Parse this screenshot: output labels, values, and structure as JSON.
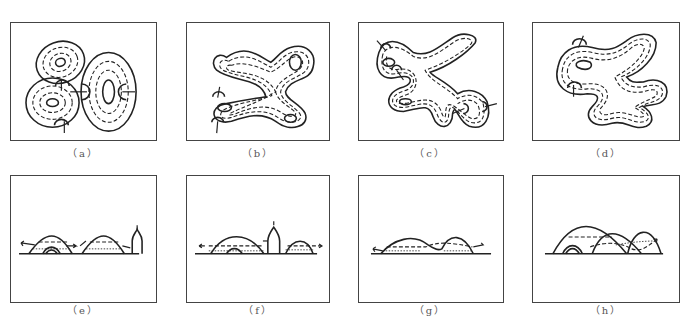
{
  "figure": {
    "panels": [
      {
        "id": "a",
        "label": "（a）",
        "view": "plan",
        "description": "three separate elliptical concentric ring bodies with inflow arrows"
      },
      {
        "id": "b",
        "label": "（b）",
        "view": "plan",
        "description": "merged branching concentric body, X-shaped"
      },
      {
        "id": "c",
        "label": "（c）",
        "view": "plan",
        "description": "complex meandering merged concentric body with multiple arrows"
      },
      {
        "id": "d",
        "label": "（d）",
        "view": "plan",
        "description": "large lobate merged concentric body with two arrows"
      },
      {
        "id": "e",
        "label": "（e）",
        "view": "section",
        "description": "two separate mounds on baseline with dashed flow arrows and a well/figure at right"
      },
      {
        "id": "f",
        "label": "（f）",
        "view": "section",
        "description": "two mounds with a central well/figure and outward arrows"
      },
      {
        "id": "g",
        "label": "（g）",
        "view": "section",
        "description": "two low overlapping mounds with outward arrows"
      },
      {
        "id": "h",
        "label": "（h）",
        "view": "section",
        "description": "three overlapping mounds with small inner mound and long dashed arrow to the right"
      }
    ],
    "caption": ""
  }
}
